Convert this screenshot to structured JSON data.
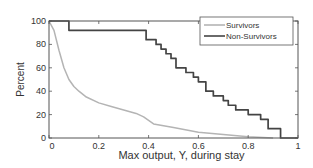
{
  "chart_data": {
    "type": "line",
    "title": "",
    "xlabel": "Max output, Y, during stay",
    "ylabel": "Percent",
    "xlim": [
      0,
      1
    ],
    "ylim": [
      0,
      100
    ],
    "xticks": [
      0,
      0.2,
      0.4,
      0.6,
      0.8,
      1
    ],
    "xtick_labels": [
      "0",
      "0.2",
      "0.4",
      "0.6",
      "0.8",
      "1"
    ],
    "yticks": [
      0,
      20,
      40,
      60,
      80,
      100
    ],
    "ytick_labels": [
      "0",
      "20",
      "40",
      "60",
      "80",
      "100"
    ],
    "grid": false,
    "legend_position": "upper right",
    "series": [
      {
        "name": "Survivors",
        "color": "#b4b4b4",
        "x": [
          0,
          0.02,
          0.04,
          0.06,
          0.08,
          0.1,
          0.12,
          0.15,
          0.2,
          0.25,
          0.3,
          0.35,
          0.38,
          0.42,
          0.5,
          0.6,
          0.7,
          0.8,
          0.9
        ],
        "y": [
          100,
          92,
          75,
          60,
          50,
          44,
          40,
          35,
          30,
          27,
          24,
          21,
          18,
          12,
          9,
          5,
          3,
          1,
          0
        ]
      },
      {
        "name": "Non-Survivors",
        "color": "#444444",
        "step": true,
        "x": [
          0,
          0.08,
          0.39,
          0.43,
          0.45,
          0.47,
          0.49,
          0.51,
          0.55,
          0.58,
          0.6,
          0.63,
          0.66,
          0.7,
          0.72,
          0.75,
          0.8,
          0.85,
          0.88,
          0.93
        ],
        "y": [
          100,
          92,
          84,
          80,
          76,
          72,
          68,
          60,
          56,
          52,
          48,
          40,
          36,
          32,
          28,
          24,
          20,
          16,
          8,
          0
        ]
      }
    ]
  }
}
